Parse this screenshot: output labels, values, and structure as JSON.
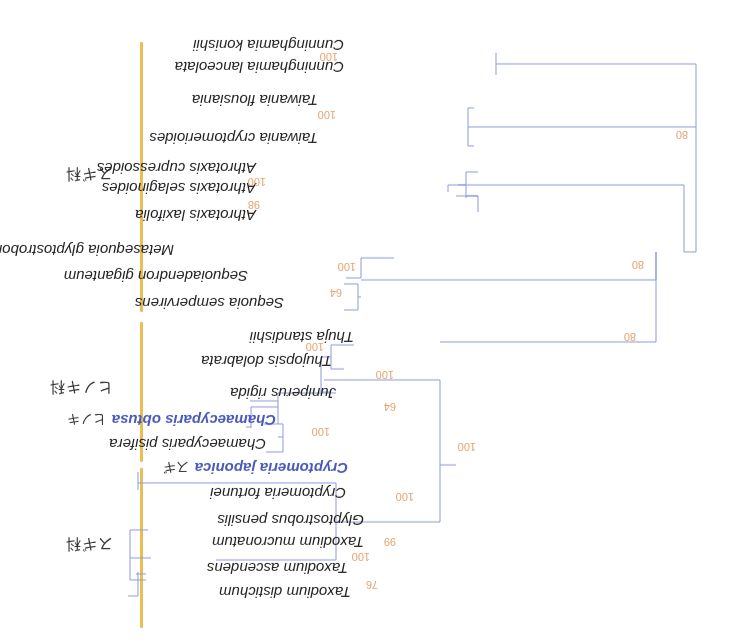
{
  "figure": {
    "orientation": "rotated-180",
    "title_clipped": "",
    "colors": {
      "branch": "#8d9ad8",
      "support_value": "#e5a36d",
      "family_bar": "#e9bf55",
      "highlight_taxon": "#4a5ab8"
    }
  },
  "families": [
    {
      "label": "スギ科",
      "range": "Cunninghamia–Sequoia"
    },
    {
      "label": "ヒノキ科",
      "range": "Thuja–Chamaecyparis"
    },
    {
      "label": "スギ科",
      "range": "Cryptomeria–Taxodium"
    }
  ],
  "taxa": [
    {
      "name": "Cunninghamia konishii"
    },
    {
      "name": "Cunninghamia lanceolata"
    },
    {
      "name": "Taiwania flousiania"
    },
    {
      "name": "Taiwania cryptomerioides"
    },
    {
      "name": "Athrotaxis cupressoides"
    },
    {
      "name": "Athrotaxis selaginoides"
    },
    {
      "name": "Athrotaxis laxifolia"
    },
    {
      "name": "Metasequoia glyptostroboides"
    },
    {
      "name": "Sequoiadendron giganteum"
    },
    {
      "name": "Sequoia sempervirens"
    },
    {
      "name": "Thuja standishii"
    },
    {
      "name": "Thujopsis dolabrata"
    },
    {
      "name": "Juniperus rigida"
    },
    {
      "name": "Chamaecyparis obtusa",
      "common": "ヒノキ",
      "highlight": true
    },
    {
      "name": "Chamaecyparis pisifera"
    },
    {
      "name": "Cryptomeria japonica",
      "common": "スギ",
      "highlight": true
    },
    {
      "name": "Cryptomeria fortunei"
    },
    {
      "name": "Glyptostrobus pensilis"
    },
    {
      "name": "Taxodium mucronatum"
    },
    {
      "name": "Taxodium ascendens"
    },
    {
      "name": "Taxodium distichum"
    }
  ],
  "supports": [
    {
      "clade": "Cunninghamia",
      "value": "100"
    },
    {
      "clade": "Taiwania",
      "value": "100"
    },
    {
      "clade": "Cunninghamia+Taiwania",
      "value": "80"
    },
    {
      "clade": "Athrotaxis selaginoides+laxifolia",
      "value": "98"
    },
    {
      "clade": "Athrotaxis",
      "value": "100"
    },
    {
      "clade": "Sequoioideae",
      "value": "100"
    },
    {
      "clade": "Sequoia+Sequoiadendron",
      "value": "64"
    },
    {
      "clade": "Athrotaxis+Sequoioideae+rest",
      "value": "80"
    },
    {
      "clade": "Cunninghamia/Taiwania+others",
      "value": "80"
    },
    {
      "clade": "Thuja+Thujopsis",
      "value": "100"
    },
    {
      "clade": "Cupressaceae s.s.",
      "value": "100"
    },
    {
      "clade": "Juniperus+Chamaecyparis",
      "value": "64"
    },
    {
      "clade": "Chamaecyparis",
      "value": "100"
    },
    {
      "clade": "Cupressaceae+Taxodioideae",
      "value": "100"
    },
    {
      "clade": "Cryptomeria+Taxodium+Glyptostrobus",
      "value": "100"
    },
    {
      "clade": "Taxodium+Glyptostrobus",
      "value": "99"
    },
    {
      "clade": "Taxodium",
      "value": "100"
    },
    {
      "clade": "Taxodium distichum+ascendens",
      "value": "76"
    }
  ]
}
